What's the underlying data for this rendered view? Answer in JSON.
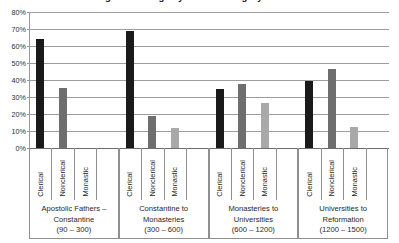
{
  "chart_data": {
    "type": "bar",
    "title": "Percentage of Writings by Author Category across Periods",
    "xlabel": "",
    "ylabel": "",
    "ylim": [
      0,
      80
    ],
    "ytick_labels": [
      "80%",
      "70%",
      "60%",
      "50%",
      "40%",
      "30%",
      "20%",
      "10%",
      "0%"
    ],
    "ytick_values": [
      80,
      70,
      60,
      50,
      40,
      30,
      20,
      10,
      0
    ],
    "grid": true,
    "legend_position": "none",
    "categories": [
      "Apostolic Fathers – Constantine (90 – 300)",
      "Constantine to Monasteries (300 – 600)",
      "Monasteries to Universities (600 – 1200)",
      "Universities to Reformation (1200 – 1500)"
    ],
    "series": [
      {
        "name": "Clerical",
        "color": "#1a1a1a",
        "values": [
          64,
          69,
          35,
          39.5
        ]
      },
      {
        "name": "Nonclerical",
        "color": "#6e6e6e",
        "values": [
          35.5,
          19,
          37.5,
          46.5
        ]
      },
      {
        "name": "Monastic",
        "color": "#a9a9a9",
        "values": [
          0,
          11.5,
          26.5,
          12.5
        ]
      }
    ]
  },
  "axis": {
    "ticks": [
      {
        "label": "80%",
        "value": 80
      },
      {
        "label": "70%",
        "value": 70
      },
      {
        "label": "60%",
        "value": 60
      },
      {
        "label": "50%",
        "value": 50
      },
      {
        "label": "40%",
        "value": 40
      },
      {
        "label": "30%",
        "value": 30
      },
      {
        "label": "20%",
        "value": 20
      },
      {
        "label": "10%",
        "value": 10
      },
      {
        "label": "0%",
        "value": 0
      }
    ]
  },
  "groups": [
    {
      "series_labels": [
        "Clerical",
        "Nonclerical",
        "Monastic"
      ],
      "caption_line1": "Apostolic Fathers –",
      "caption_line2": "Constantine",
      "caption_line3": "(90 – 300)"
    },
    {
      "series_labels": [
        "Clerical",
        "Nonclerical",
        "Monastic"
      ],
      "caption_line1": "Constantine to",
      "caption_line2": "Monasteries",
      "caption_line3": "(300 – 600)"
    },
    {
      "series_labels": [
        "Clerical",
        "Nonclerical",
        "Monastic"
      ],
      "caption_line1": "Monasteries to",
      "caption_line2": "Universities",
      "caption_line3": "(600 – 1200)"
    },
    {
      "series_labels": [
        "Clerical",
        "Nonclerical",
        "Monastic"
      ],
      "caption_line1": "Universities to",
      "caption_line2": "Reformation",
      "caption_line3": "(1200 – 1500)"
    }
  ]
}
